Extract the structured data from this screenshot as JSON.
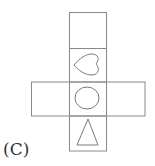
{
  "figure": {
    "label": "(C)",
    "colors": {
      "line": "#8a8a8a",
      "shape": "#7a7a7a",
      "background": "#ffffff"
    },
    "faces": [
      {
        "id": "top",
        "symbol": "blank"
      },
      {
        "id": "upper-middle",
        "symbol": "heart (pointing left)"
      },
      {
        "id": "left-wing",
        "symbol": "blank"
      },
      {
        "id": "center",
        "symbol": "circle"
      },
      {
        "id": "right-wing",
        "symbol": "blank"
      },
      {
        "id": "bottom",
        "symbol": "triangle"
      }
    ]
  }
}
